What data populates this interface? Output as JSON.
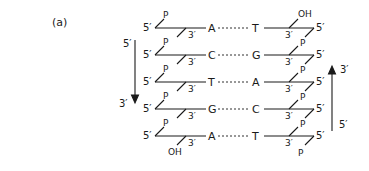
{
  "panel_label": "(a)",
  "left_strand": {
    "direction_top": "5′",
    "direction_bottom": "3′",
    "end_5_label": "5′",
    "end_3_label": "3′",
    "phosphate_label": "P",
    "terminal_5_group": "P",
    "terminal_3_group": "OH"
  },
  "right_strand": {
    "direction_top": "3′",
    "direction_bottom": "5′",
    "end_5_label": "5′",
    "end_3_label": "3′",
    "phosphate_label": "P",
    "terminal_3_group": "OH",
    "terminal_5_group": "P"
  },
  "base_pairs": [
    {
      "left": "A",
      "right": "T"
    },
    {
      "left": "C",
      "right": "G"
    },
    {
      "left": "T",
      "right": "A"
    },
    {
      "left": "G",
      "right": "C"
    },
    {
      "left": "A",
      "right": "T"
    }
  ]
}
